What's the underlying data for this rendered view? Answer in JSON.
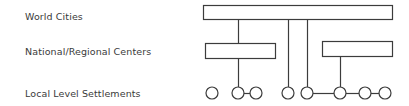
{
  "diagram": {
    "type": "hierarchy-diagram",
    "stroke_color": "#3c3c3c",
    "fill_color": "#ffffff",
    "background_color": "#ffffff",
    "tiers": [
      {
        "id": "world-cities",
        "label": "World Cities"
      },
      {
        "id": "national-centers",
        "label": "National/Regional Centers"
      },
      {
        "id": "local-settlements",
        "label": "Local Level Settlements"
      }
    ],
    "nodes": {
      "world_cities_bar": {
        "x": 203,
        "y": 5,
        "width": 189,
        "height": 14
      },
      "national_boxes": [
        {
          "id": "national-box-left",
          "x": 205,
          "y": 43,
          "width": 70,
          "height": 15
        },
        {
          "id": "national-box-right",
          "x": 322,
          "y": 41,
          "width": 70,
          "height": 15
        }
      ],
      "settlement_circles": [
        {
          "id": "settlement-1",
          "cx": 212,
          "cy": 93,
          "r": 6
        },
        {
          "id": "settlement-2",
          "cx": 238,
          "cy": 93,
          "r": 6
        },
        {
          "id": "settlement-3",
          "cx": 256,
          "cy": 93,
          "r": 6
        },
        {
          "id": "settlement-4",
          "cx": 288,
          "cy": 93,
          "r": 6
        },
        {
          "id": "settlement-5",
          "cx": 307,
          "cy": 93,
          "r": 6
        },
        {
          "id": "settlement-6",
          "cx": 340,
          "cy": 93,
          "r": 6
        },
        {
          "id": "settlement-7",
          "cx": 365,
          "cy": 93,
          "r": 6
        },
        {
          "id": "settlement-8",
          "cx": 385,
          "cy": 93,
          "r": 6
        }
      ]
    },
    "connectors": {
      "vertical": [
        {
          "id": "connector-bar-to-left-box",
          "x": 238,
          "y1": 19,
          "y2": 43
        },
        {
          "id": "connector-bar-to-node-4",
          "x": 288,
          "y1": 19,
          "y2": 87
        },
        {
          "id": "connector-bar-to-node-5",
          "x": 307,
          "y1": 19,
          "y2": 87
        },
        {
          "id": "connector-left-box-to-node-2",
          "x": 238,
          "y1": 58,
          "y2": 87
        },
        {
          "id": "connector-right-box-to-node-6",
          "x": 340,
          "y1": 56,
          "y2": 87
        }
      ],
      "horizontal": [
        {
          "id": "link-node-2-to-node-3",
          "x1": 244,
          "x2": 250,
          "y": 93
        },
        {
          "id": "link-node-5-to-node-6",
          "x1": 313,
          "x2": 334,
          "y": 93
        },
        {
          "id": "link-node-6-to-node-7",
          "x1": 346,
          "x2": 359,
          "y": 93
        },
        {
          "id": "link-node-7-to-node-8",
          "x1": 371,
          "x2": 379,
          "y": 93
        }
      ]
    }
  }
}
